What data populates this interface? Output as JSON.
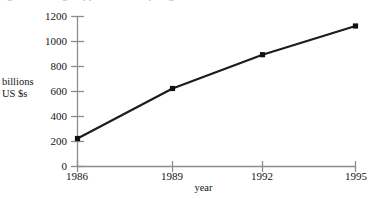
{
  "clipped_title_text": "figure heading clipped above top edge",
  "chart_data": {
    "type": "line",
    "title": "",
    "xlabel": "year",
    "ylabel": "billions US $s",
    "ylabel_lines": [
      "billions",
      "US $s"
    ],
    "x": [
      1986,
      1989,
      1992,
      1995
    ],
    "categories": [
      "1986",
      "1989",
      "1992",
      "1995"
    ],
    "values": [
      220,
      620,
      890,
      1120
    ],
    "series": [
      {
        "name": "billions US $s",
        "values": [
          220,
          620,
          890,
          1120
        ]
      }
    ],
    "xlim": [
      1986,
      1995
    ],
    "ylim": [
      0,
      1200
    ],
    "ytick_labels": [
      "0",
      "200",
      "400",
      "600",
      "800",
      "1000",
      "1200"
    ],
    "ytick_values": [
      0,
      200,
      400,
      600,
      800,
      1000,
      1200
    ],
    "xtick_labels": [
      "1986",
      "1989",
      "1992",
      "1995"
    ],
    "xtick_values": [
      1986,
      1989,
      1992,
      1995
    ],
    "grid": false,
    "legend": false,
    "legend_position": "none",
    "marker": "square",
    "colors": {
      "line": "#1c1c1c",
      "marker": "#111111",
      "axis": "#8d8d8d",
      "text": "#141414",
      "background": "#ffffff"
    }
  }
}
